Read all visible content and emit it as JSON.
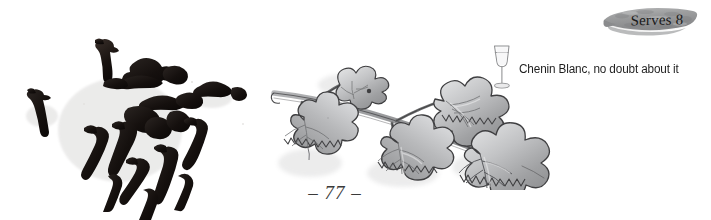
{
  "page": {
    "background_color": "#ffffff",
    "page_number": "– 77 –",
    "width": 711,
    "height": 220
  },
  "cloves_photo": {
    "caption": "whole dried cloves",
    "icon_name": "cloves-photo",
    "clove_color": "#141110",
    "background_color": "#ffffff"
  },
  "vine_illustration": {
    "caption": "grapevine branch with five leaves",
    "icon_name": "grapevine-branch-illustration",
    "leaf_fill": "#a9aaac",
    "leaf_fill_light": "#d2d3d5",
    "ink_color": "#3c3c3e",
    "leaf_count": 5
  },
  "wine_pairing": {
    "icon_name": "wine-glass-icon",
    "text": "Chenin Blanc, no doubt about it",
    "text_color": "#1f1f1f",
    "glass_outline_color": "#8e8f91"
  },
  "serves_badge": {
    "label": "Serves 8",
    "shape_color": "#9d9e9f",
    "shape_color_dark": "#7d7e80",
    "text_color": "#1a1a1a"
  }
}
